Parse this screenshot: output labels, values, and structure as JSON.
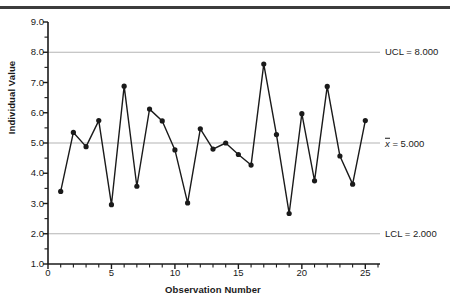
{
  "chart_data": {
    "type": "line",
    "title": "",
    "subtitle": "",
    "xlabel": "Observation Number",
    "ylabel": "Individual Value",
    "xlim": [
      0,
      26
    ],
    "ylim": [
      1.0,
      9.0
    ],
    "grid": false,
    "legend_position": "right-outside",
    "x": [
      1,
      2,
      3,
      4,
      5,
      6,
      7,
      8,
      9,
      10,
      11,
      12,
      13,
      14,
      15,
      16,
      17,
      18,
      19,
      20,
      21,
      22,
      23,
      24,
      25
    ],
    "values": [
      3.4,
      5.35,
      4.88,
      5.74,
      2.96,
      6.88,
      3.57,
      6.12,
      5.73,
      4.77,
      3.02,
      5.47,
      4.8,
      5.0,
      4.62,
      4.27,
      7.61,
      5.28,
      2.67,
      5.97,
      3.75,
      6.87,
      4.57,
      3.64,
      5.74
    ],
    "series": [
      {
        "name": "Individual Value",
        "values": [
          3.4,
          5.35,
          4.88,
          5.74,
          2.96,
          6.88,
          3.57,
          6.12,
          5.73,
          4.77,
          3.02,
          5.47,
          4.8,
          5.0,
          4.62,
          4.27,
          7.61,
          5.28,
          2.67,
          5.97,
          3.75,
          6.87,
          4.57,
          3.64,
          5.74
        ]
      }
    ],
    "x_ticks": [
      0,
      5,
      10,
      15,
      20,
      25
    ],
    "x_tick_labels": [
      "0",
      "5",
      "10",
      "15",
      "20",
      "25"
    ],
    "x_minor_ticks": [
      1,
      2,
      3,
      4,
      6,
      7,
      8,
      9,
      11,
      12,
      13,
      14,
      16,
      17,
      18,
      19,
      21,
      22,
      23,
      24,
      26
    ],
    "y_ticks": [
      1.0,
      2.0,
      3.0,
      4.0,
      5.0,
      6.0,
      7.0,
      8.0,
      9.0
    ],
    "y_tick_labels": [
      "1.0",
      "2.0",
      "3.0",
      "4.0",
      "5.0",
      "6.0",
      "7.0",
      "8.0",
      "9.0"
    ],
    "y_minor_ticks": [
      1.5,
      2.5,
      3.5,
      4.5,
      5.5,
      6.5,
      7.5,
      8.5
    ],
    "reference_lines": [
      {
        "name": "ucl",
        "value": 8.0,
        "label": "UCL = 8.000",
        "label_plain": "UCL = 8.000",
        "color": "#b4b4b4"
      },
      {
        "name": "center",
        "value": 5.0,
        "label": "x̄ = 5.000",
        "label_symbol": "x",
        "label_text": " = 5.000",
        "color": "#b4b4b4"
      },
      {
        "name": "lcl",
        "value": 2.0,
        "label": "LCL = 2.000",
        "label_plain": "LCL = 2.000",
        "color": "#b4b4b4"
      }
    ],
    "colors": {
      "line": "#1a1a1a",
      "marker": "#1a1a1a",
      "axis": "#1a1a1a",
      "reference_line": "#b4b4b4",
      "top_rule": "#3c3c3c",
      "background": "#ffffff"
    }
  },
  "axis_titles": {
    "x": "Observation Number",
    "y": "Individual Value"
  }
}
